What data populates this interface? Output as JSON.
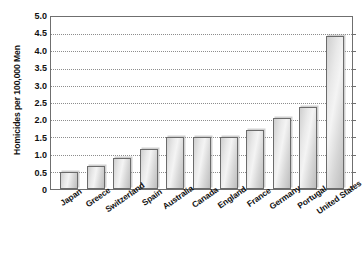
{
  "chart_data": {
    "type": "bar",
    "title": "",
    "xlabel": "",
    "ylabel": "Homicides per 100,000 Men",
    "ylim": [
      0,
      5.0
    ],
    "ytick_labels": [
      "5.0",
      "4.5",
      "4.0",
      "3.5",
      "3.0",
      "2.5",
      "2.0",
      "1.5",
      "1.0",
      "0.5",
      "0"
    ],
    "ytick_values": [
      5.0,
      4.5,
      4.0,
      3.5,
      3.0,
      2.5,
      2.0,
      1.5,
      1.0,
      0.5,
      0
    ],
    "grid": true,
    "grid_axis": "y",
    "legend": "none",
    "categories": [
      "Japan",
      "Greece",
      "Switzerland",
      "Spain",
      "Australia",
      "Canada",
      "England",
      "France",
      "Germany",
      "Portugal",
      "United States"
    ],
    "values": [
      0.5,
      0.68,
      0.9,
      1.15,
      1.5,
      1.5,
      1.52,
      1.72,
      2.05,
      2.37,
      4.45
    ],
    "bar_fill": "#e4e4e4",
    "bar_edge": "#6b6b6b",
    "plot_border": "#6f6f6f",
    "gridline_color": "#8d8d8d",
    "text_color": "#111111"
  },
  "footer": {
    "stray_mark": ""
  }
}
